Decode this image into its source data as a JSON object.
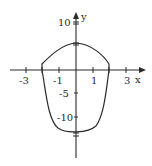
{
  "figure": {
    "type": "closed-curve-graph",
    "axes": {
      "x_label": "x",
      "y_label": "y",
      "x_ticks": [
        {
          "value": -3,
          "label": "-3"
        },
        {
          "value": -1,
          "label": "-1"
        },
        {
          "value": 1,
          "label": "1"
        },
        {
          "value": 3,
          "label": "3"
        }
      ],
      "y_ticks": [
        {
          "value": 10,
          "label": "10"
        },
        {
          "value": -5,
          "label": "-5"
        },
        {
          "value": -10,
          "label": "-10"
        }
      ]
    },
    "curve": {
      "description": "Closed curve: upper arc crossing y-axis near y=6, lower arc crossing near y=-13.5, meeting x-axis near x=-2 and x=2",
      "y_intercepts": [
        6,
        -13.5
      ],
      "x_intercepts": [
        -2,
        2
      ]
    },
    "colors": {
      "ink": "#2a2a2a",
      "background": "#ffffff"
    }
  }
}
